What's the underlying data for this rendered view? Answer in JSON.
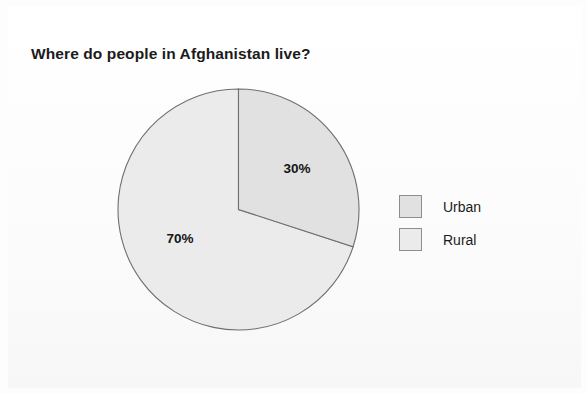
{
  "chart_data": {
    "type": "pie",
    "title": "Where do people in Afghanistan live?",
    "categories": [
      "Urban",
      "Rural"
    ],
    "values": [
      30,
      70
    ],
    "value_labels": [
      "30%",
      "70%"
    ],
    "unit": "%",
    "colors": [
      "#e1e1e1",
      "#ebebeb"
    ],
    "start_angle_deg": 0,
    "direction": "clockwise",
    "legend_position": "right",
    "grid": false,
    "xlabel": "",
    "ylabel": "",
    "slices": [
      {
        "name": "Urban",
        "value": 30,
        "label": "30%",
        "color": "#e1e1e1",
        "start_deg": 0,
        "end_deg": 108
      },
      {
        "name": "Rural",
        "value": 70,
        "label": "70%",
        "color": "#ebebeb",
        "start_deg": 108,
        "end_deg": 360
      }
    ]
  },
  "legend": {
    "items": [
      {
        "label": "Urban",
        "color": "#e1e1e1"
      },
      {
        "label": "Rural",
        "color": "#ebebeb"
      }
    ]
  },
  "style": {
    "outline_color": "#6f6f6f",
    "text_color": "#1b1b1b",
    "background": "#fdfdfd"
  }
}
